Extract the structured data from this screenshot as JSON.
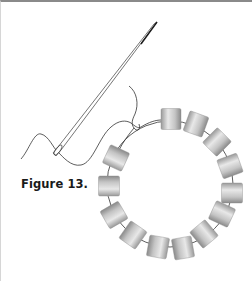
{
  "figure": {
    "caption": "Figure 13.",
    "colors": {
      "border_top": "#8a8a8a",
      "border_left": "#d6d6d6",
      "thread": "#333333",
      "needle": "#3a3a3a",
      "bead_light": "#e6e6e6",
      "bead_dark": "#8e8e8e"
    },
    "circle": {
      "cx": 169,
      "cy": 182,
      "r": 63
    },
    "bead_count": 13,
    "beads": [
      {
        "x": 170,
        "y": 117,
        "angle": 0
      },
      {
        "x": 195,
        "y": 122,
        "angle": 20
      },
      {
        "x": 216,
        "y": 140,
        "angle": 45
      },
      {
        "x": 229,
        "y": 164,
        "angle": 70
      },
      {
        "x": 231,
        "y": 191,
        "angle": 90
      },
      {
        "x": 221,
        "y": 212,
        "angle": 115
      },
      {
        "x": 203,
        "y": 232,
        "angle": 140
      },
      {
        "x": 182,
        "y": 246,
        "angle": 170
      },
      {
        "x": 157,
        "y": 245,
        "angle": 190
      },
      {
        "x": 132,
        "y": 233,
        "angle": 215
      },
      {
        "x": 113,
        "y": 213,
        "angle": 240
      },
      {
        "x": 108,
        "y": 184,
        "angle": 270
      },
      {
        "x": 115,
        "y": 156,
        "angle": 295
      }
    ]
  }
}
